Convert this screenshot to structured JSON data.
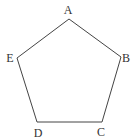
{
  "diagram": {
    "shape": "pentagon",
    "stroke_color": "#444444",
    "vertices": [
      {
        "label": "A",
        "x": 69,
        "y": 19,
        "lx": 68,
        "ly": 14
      },
      {
        "label": "B",
        "x": 121,
        "y": 57,
        "lx": 126,
        "ly": 62
      },
      {
        "label": "C",
        "x": 102,
        "y": 122,
        "lx": 101,
        "ly": 136
      },
      {
        "label": "D",
        "x": 37,
        "y": 122,
        "lx": 38,
        "ly": 137
      },
      {
        "label": "E",
        "x": 17,
        "y": 58,
        "lx": 10,
        "ly": 62
      }
    ]
  }
}
